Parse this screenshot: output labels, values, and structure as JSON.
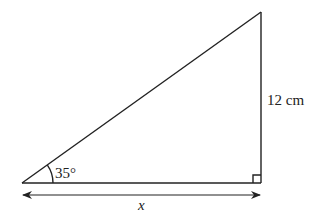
{
  "diagram": {
    "type": "right-triangle",
    "angle_label": "35°",
    "side_label": "12 cm",
    "base_label": "x",
    "colors": {
      "stroke": "#222222",
      "background": "#ffffff"
    }
  }
}
